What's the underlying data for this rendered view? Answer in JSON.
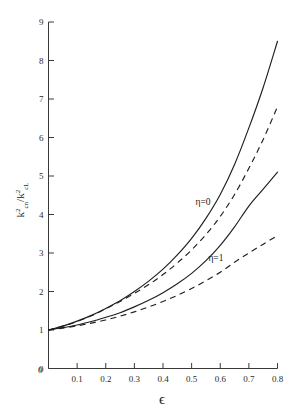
{
  "chart_data": {
    "type": "line",
    "title": "",
    "subtitle": "",
    "xlabel": "ϵ",
    "ylabel": "k²cn / k²cL",
    "ylabel_parts": {
      "num_base": "k",
      "num_sup": "2",
      "num_sub": "cn",
      "slash": "/",
      "den_base": "k",
      "den_sup": "2",
      "den_sub": "cL"
    },
    "xlim": [
      0,
      0.8
    ],
    "ylim": [
      0,
      9
    ],
    "grid": false,
    "legend_position": "inline-annotations",
    "xticks": [
      0,
      0.1,
      0.2,
      0.3,
      0.4,
      0.5,
      0.6,
      0.7,
      0.8
    ],
    "xticklabels": [
      "0",
      "0.1",
      "0.2",
      "0.3",
      "0.4",
      "0.5",
      "0.6",
      "0.7",
      "0.8"
    ],
    "yticks": [
      0,
      1,
      2,
      3,
      4,
      5,
      6,
      7,
      8,
      9
    ],
    "yticklabels": [
      "0",
      "1",
      "2",
      "3",
      "4",
      "5",
      "6",
      "7",
      "8",
      "9"
    ],
    "annotations": [
      {
        "text": "η=0",
        "x": 0.54,
        "y": 4.25
      },
      {
        "text": "η=1",
        "x": 0.585,
        "y": 2.78
      }
    ],
    "x": [
      0,
      0.05,
      0.1,
      0.15,
      0.2,
      0.25,
      0.3,
      0.35,
      0.4,
      0.45,
      0.5,
      0.55,
      0.6,
      0.65,
      0.7,
      0.75,
      0.8
    ],
    "series": [
      {
        "name": "η=0 solid",
        "style": "solid",
        "values": [
          1.0,
          1.1,
          1.23,
          1.38,
          1.56,
          1.76,
          2.0,
          2.27,
          2.58,
          2.95,
          3.38,
          3.9,
          4.52,
          5.3,
          6.25,
          7.3,
          8.5
        ]
      },
      {
        "name": "η=0 dashed",
        "style": "dashed",
        "values": [
          1.0,
          1.1,
          1.22,
          1.37,
          1.55,
          1.74,
          1.95,
          2.18,
          2.44,
          2.74,
          3.08,
          3.48,
          3.95,
          4.52,
          5.2,
          5.95,
          6.8
        ]
      },
      {
        "name": "η=1 solid",
        "style": "solid",
        "values": [
          1.0,
          1.06,
          1.13,
          1.22,
          1.33,
          1.45,
          1.6,
          1.77,
          1.97,
          2.2,
          2.47,
          2.8,
          3.2,
          3.68,
          4.22,
          4.66,
          5.1
        ]
      },
      {
        "name": "η=1 dashed",
        "style": "dashed",
        "values": [
          1.0,
          1.05,
          1.11,
          1.18,
          1.26,
          1.36,
          1.47,
          1.6,
          1.74,
          1.9,
          2.08,
          2.28,
          2.5,
          2.76,
          3.0,
          3.23,
          3.45
        ]
      }
    ]
  },
  "colors": {
    "axis": "#3a3a3a",
    "curve": "#1f1f1f",
    "background": "#ffffff"
  }
}
